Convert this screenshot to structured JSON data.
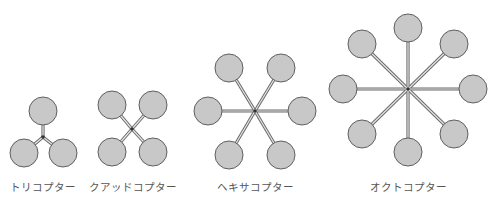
{
  "style": {
    "rotor_fill": "#c8c8c8",
    "rotor_stroke": "#5f5f5f",
    "arm_outer": "#6a6a6a",
    "arm_inner": "#e6e6e6",
    "hub_color": "#333333",
    "background": "#ffffff"
  },
  "configurations": [
    {
      "name": "tricopter",
      "label": "トリコプター",
      "rotor_count": 3,
      "label_x": 43,
      "hub": [
        43,
        137
      ],
      "rotor_radius": 14,
      "rotors": [
        [
          43,
          111
        ],
        [
          24,
          153
        ],
        [
          63,
          153
        ]
      ]
    },
    {
      "name": "quadcopter",
      "label": "クアッドコプター",
      "rotor_count": 4,
      "label_x": 133,
      "hub": [
        132,
        129
      ],
      "rotor_radius": 14,
      "rotors": [
        [
          112,
          105
        ],
        [
          153,
          105
        ],
        [
          112,
          152
        ],
        [
          153,
          152
        ]
      ]
    },
    {
      "name": "hexacopter",
      "label": "ヘキサコプター",
      "rotor_count": 6,
      "label_x": 255,
      "hub": [
        255,
        111
      ],
      "rotor_radius": 14,
      "rotors": [
        [
          229,
          68
        ],
        [
          281,
          68
        ],
        [
          208,
          111
        ],
        [
          302,
          111
        ],
        [
          229,
          155
        ],
        [
          281,
          155
        ]
      ]
    },
    {
      "name": "octocopter",
      "label": "オクトコプター",
      "rotor_count": 8,
      "label_x": 408,
      "hub": [
        408,
        89
      ],
      "rotor_radius": 14,
      "rotors": [
        [
          408,
          28
        ],
        [
          362,
          44
        ],
        [
          454,
          44
        ],
        [
          343,
          89
        ],
        [
          473,
          89
        ],
        [
          362,
          134
        ],
        [
          454,
          134
        ],
        [
          408,
          152
        ]
      ]
    }
  ]
}
